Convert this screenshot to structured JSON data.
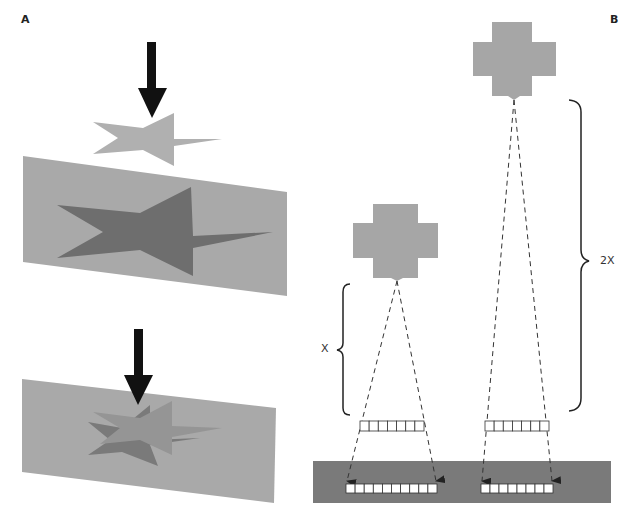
{
  "panels": {
    "a": {
      "label": "A"
    },
    "b": {
      "label": "B"
    }
  },
  "dimensions": {
    "near_label": "X",
    "far_label": "2X"
  },
  "detector_bars": {
    "near_source_cells": 7,
    "near_image_cells": 10,
    "far_source_cells": 7,
    "far_image_cells": 8
  },
  "colors": {
    "plane": "#a9a9a9",
    "light_star": "#b0b0b0",
    "dark_star": "#6e6e6e",
    "source": "#a6a6a6",
    "detector_strip": "#7a7a7a",
    "arrow": "#111111"
  }
}
